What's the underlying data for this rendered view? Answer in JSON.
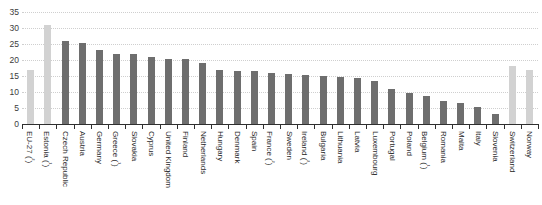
{
  "chart_data": {
    "type": "bar",
    "title": "",
    "subtitle": "",
    "xlabel": "",
    "ylabel": "",
    "ylim": [
      0,
      35
    ],
    "ytick_step": 5,
    "grid": true,
    "legend": "none",
    "ytick_labels": [
      "35",
      "30",
      "25",
      "20",
      "15",
      "10",
      "5",
      "0"
    ],
    "ytick_values": [
      35,
      30,
      25,
      20,
      15,
      10,
      5,
      0
    ],
    "colors": {
      "bar_default": "#6e6e6e",
      "bar_highlight": "#d2d2d2",
      "gridline": "#cfcfcf",
      "axis": "#2f2f2f",
      "text": "#2b2b2b",
      "background": "#ffffff"
    },
    "categories": [
      "EU-27 (²)",
      "Estonia (¹)",
      "Czech Republic",
      "Austria",
      "Germany",
      "Greece (¹)",
      "Slovakia",
      "Cyprus",
      "United Kingdom",
      "Finland",
      "Netherlands",
      "Hungary",
      "Denmark",
      "Spain",
      "France (²)",
      "Sweden",
      "Ireland (²)",
      "Bulgaria",
      "Lithuania",
      "Latvia",
      "Luxembourg",
      "Portugal",
      "Poland",
      "Belgium (¹)",
      "Romania",
      "Malta",
      "Italy",
      "Slovenia",
      "Switzerland",
      "Norway"
    ],
    "values": [
      17.0,
      31.0,
      26.0,
      25.4,
      23.2,
      22.0,
      21.9,
      21.0,
      20.3,
      20.3,
      19.0,
      17.0,
      16.6,
      16.5,
      15.8,
      15.6,
      15.4,
      15.0,
      14.6,
      14.4,
      13.5,
      11.0,
      9.6,
      8.6,
      7.3,
      6.6,
      5.4,
      3.0,
      18.2,
      17.0
    ],
    "highlight_indices": [
      0,
      1,
      28,
      29
    ]
  }
}
